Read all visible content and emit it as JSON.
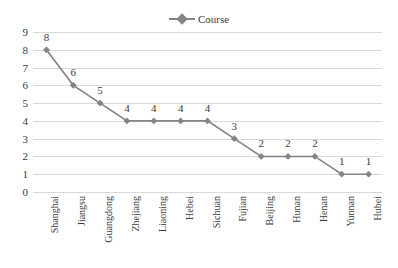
{
  "chart_data": {
    "type": "line",
    "title": "",
    "subtitle": "",
    "xlabel": "",
    "ylabel": "",
    "ylim": [
      0,
      9
    ],
    "ytick_step": 1,
    "yticks": [
      "9",
      "8",
      "7",
      "6",
      "5",
      "4",
      "3",
      "2",
      "1",
      "0"
    ],
    "grid": "horizontal",
    "legend_position": "top-center",
    "show_data_labels": true,
    "categories": [
      "Shanghai",
      "Jiangsu",
      "Guangdong",
      "Zhejiang",
      "Liaoning",
      "Hebei",
      "Sichuan",
      "Fujian",
      "Beijing",
      "Hunan",
      "Henan",
      "Yunnan",
      "Hubei"
    ],
    "series": [
      {
        "name": "Course",
        "marker": "diamond",
        "color": "#848484",
        "values": [
          8,
          6,
          5,
          4,
          4,
          4,
          4,
          3,
          2,
          2,
          2,
          1,
          1
        ]
      }
    ]
  },
  "legend": {
    "entries": [
      {
        "label": "Course",
        "marker": "diamond-marker-icon",
        "color": "#848484"
      }
    ]
  },
  "colors": {
    "series": "#848484",
    "gridline": "#d9d9d9",
    "text": "#3a3a3a",
    "background": "#ffffff"
  }
}
